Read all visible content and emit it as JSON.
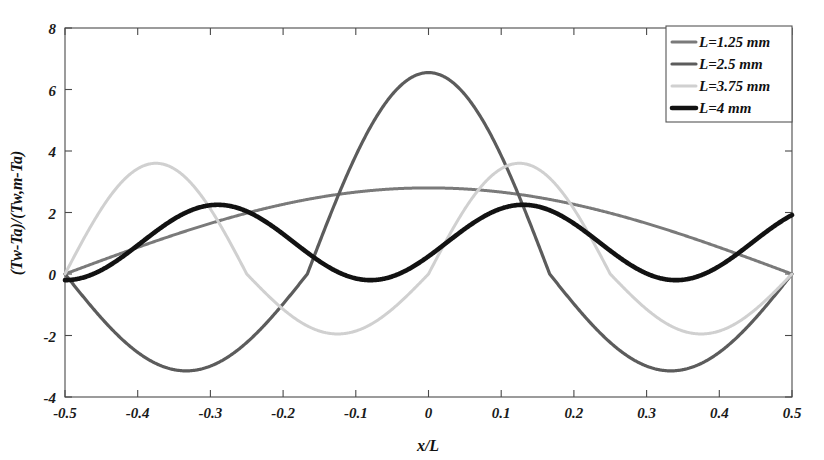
{
  "chart_data": {
    "type": "line",
    "title": "",
    "xlabel": "x/L",
    "ylabel": "(Tw-Ta)/(Tw,m-Ta)",
    "xlim": [
      -0.5,
      0.5
    ],
    "ylim": [
      -4,
      8
    ],
    "xticks": [
      -0.5,
      -0.4,
      -0.3,
      -0.2,
      -0.1,
      0,
      0.1,
      0.2,
      0.3,
      0.4,
      0.5
    ],
    "xtick_labels": [
      "-0.5",
      "-0.4",
      "-0.3",
      "-0.2",
      "-0.1",
      "0",
      "0.1",
      "0.2",
      "0.3",
      "0.4",
      "0.5"
    ],
    "yticks": [
      -4,
      -2,
      0,
      2,
      4,
      6,
      8
    ],
    "ytick_labels": [
      "-4",
      "-2",
      "0",
      "2",
      "4",
      "6",
      "8"
    ],
    "grid": false,
    "legend_position": "top-right",
    "series": [
      {
        "name": "L=1.25 mm",
        "color": "#7a7a7a",
        "width": 3.0,
        "amplitude": 2.8,
        "halfcycles": 1,
        "sign": 1,
        "description": "Single broad hump, peak 2.8 at x=0, zero at x=-0.5 and x=0.5"
      },
      {
        "name": "L=2.5 mm",
        "color": "#5c5c5c",
        "width": 3.2,
        "amplitude": 6.55,
        "halfcycles": 3,
        "sign": -1,
        "description": "Three half-cycles; min -3.15 near x=-0.42, max 6.55 near x=-0.21, min -3.15 at x=0, max 6.55 near x=0.21, min -3.15 near x=0.42"
      },
      {
        "name": "L=3.75 mm",
        "color": "#d0d0d0",
        "width": 3.0,
        "amplitude": 3.6,
        "halfcycles": 4,
        "sign": 1,
        "description": "Four half-cycles; peak 3.6 near x=-0.37 and x=-0.13, trough -1.95 near x=-0.27 and x=0"
      },
      {
        "name": "L=4 mm",
        "color": "#121212",
        "width": 4.6,
        "amplitude": 2.25,
        "halfcycles": 5,
        "sign": 1,
        "description": "Five-ish cycles; peaks about 2.25 near x=-0.42, -0.21, 0, 0.21, 0.42; troughs about -0.2"
      }
    ],
    "legend_entries": [
      "L=1.25 mm",
      "L=2.5 mm",
      "L=3.75 mm",
      "L=4 mm"
    ]
  },
  "axis": {
    "x_title": "x/L",
    "y_title": "(Tw-Ta)/(Tw,m-Ta)"
  }
}
